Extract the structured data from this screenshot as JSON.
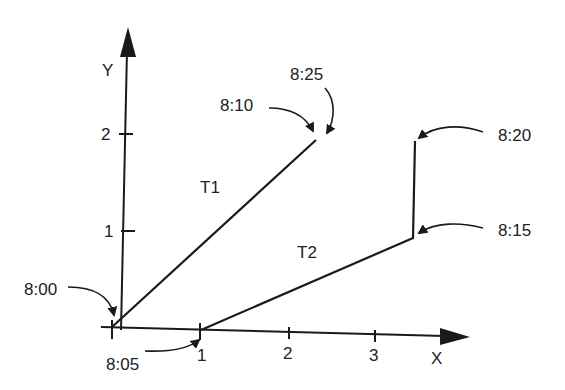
{
  "diagram": {
    "axes": {
      "x_label": "X",
      "y_label": "Y",
      "x_ticks": [
        "1",
        "2",
        "3"
      ],
      "y_ticks": [
        "1",
        "2"
      ]
    },
    "paths": [
      {
        "name": "T1",
        "label": "T1",
        "points": [
          [
            0,
            0
          ],
          [
            2,
            2
          ]
        ]
      },
      {
        "name": "T2",
        "label": "T2",
        "points": [
          [
            1,
            0
          ],
          [
            3,
            1
          ],
          [
            3,
            2
          ]
        ]
      }
    ],
    "time_annotations": [
      {
        "label": "8:00",
        "point": [
          0,
          0
        ],
        "path": "T1"
      },
      {
        "label": "8:10",
        "point": [
          2,
          2
        ],
        "path": "T1"
      },
      {
        "label": "8:25",
        "point": [
          2,
          2
        ],
        "path": "T1"
      },
      {
        "label": "8:05",
        "point": [
          1,
          0
        ],
        "path": "T2"
      },
      {
        "label": "8:15",
        "point": [
          3,
          1
        ],
        "path": "T2"
      },
      {
        "label": "8:20",
        "point": [
          3,
          2
        ],
        "path": "T2"
      }
    ],
    "colors": {
      "line": "#1a1a1a",
      "text": "#222222",
      "background": "#ffffff"
    }
  }
}
